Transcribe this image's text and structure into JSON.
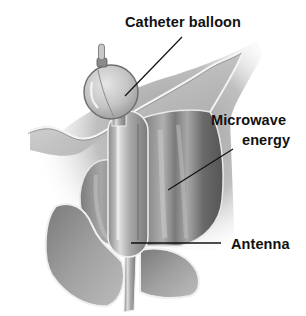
{
  "figure": {
    "style": "grayscale medical illustration"
  },
  "labels": {
    "catheter_balloon": "Catheter balloon",
    "microwave_line1": "Microwave",
    "microwave_line2": "energy",
    "antenna": "Antenna"
  },
  "structures": [
    {
      "name": "catheter-tip",
      "label": null
    },
    {
      "name": "catheter-balloon",
      "label": "Catheter balloon"
    },
    {
      "name": "bladder-neck-tissue",
      "label": null
    },
    {
      "name": "prostate-right-lobe",
      "label": "Microwave energy"
    },
    {
      "name": "prostate-left-lobe",
      "label": null
    },
    {
      "name": "antenna",
      "label": "Antenna"
    },
    {
      "name": "lower-left-tissue",
      "label": null
    },
    {
      "name": "lower-right-tissue",
      "label": null
    },
    {
      "name": "urethra-catheter-shaft",
      "label": null
    }
  ],
  "colors": {
    "background": "#ffffff",
    "label_text": "#111111",
    "leader_line": "#111111",
    "tissue_light": "#c8c8c8",
    "tissue_mid": "#9a9a9a",
    "tissue_dark": "#5e5e5e",
    "outline_highlight": "#f2f2f2"
  }
}
